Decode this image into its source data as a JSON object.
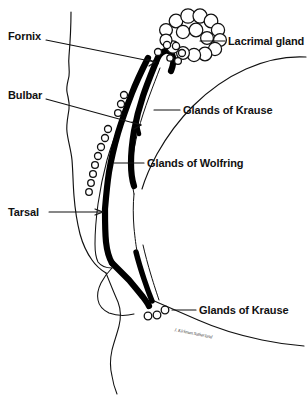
{
  "figure": {
    "type": "anatomical-line-diagram",
    "background_color": "#ffffff",
    "ink_color": "#111111",
    "conjunctiva_color": "#000000"
  },
  "labels": {
    "fornix": "Fornix",
    "bulbar": "Bulbar",
    "tarsal": "Tarsal",
    "lacrimal_gland": "Lacrimal gland",
    "glands_of_krause_upper": "Glands of Krause",
    "glands_of_wolfring": "Glands of Wolfring",
    "glands_of_krause_lower": "Glands of Krause"
  },
  "signature": {
    "text": "J. Kirkman Sutherland"
  },
  "structures": {
    "lacrimal_gland_lobules": 16,
    "krause_glands_upper": 6,
    "wolfring_glands_chain": 11,
    "krause_glands_lower": 3
  }
}
